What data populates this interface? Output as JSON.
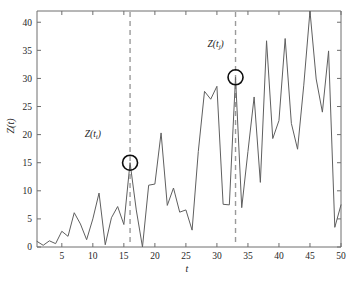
{
  "chart_data": {
    "type": "line",
    "title": "",
    "xlabel": "t",
    "ylabel": "Z(t)",
    "xlim": [
      1,
      50
    ],
    "ylim": [
      0,
      42
    ],
    "grid": false,
    "legend": null,
    "xticks": [
      5,
      10,
      15,
      20,
      25,
      30,
      35,
      40,
      45,
      50
    ],
    "yticks": [
      0,
      5,
      10,
      15,
      20,
      25,
      30,
      35,
      40
    ],
    "x": [
      1,
      2,
      3,
      4,
      5,
      6,
      7,
      8,
      9,
      10,
      11,
      12,
      13,
      14,
      15,
      16,
      17,
      18,
      19,
      20,
      21,
      22,
      23,
      24,
      25,
      26,
      27,
      28,
      29,
      30,
      31,
      32,
      33,
      34,
      35,
      36,
      37,
      38,
      39,
      40,
      41,
      42,
      43,
      44,
      45,
      46,
      47,
      48,
      49,
      50
    ],
    "series": [
      {
        "name": "Z(t)",
        "color": "#5f5f5f",
        "values": [
          1.0,
          0.3,
          1.1,
          0.6,
          2.8,
          1.9,
          6.1,
          4.1,
          1.3,
          5.0,
          9.6,
          0.4,
          5.2,
          7.2,
          4.0,
          15.0,
          6.6,
          0.0,
          11.0,
          11.2,
          20.3,
          7.4,
          10.5,
          6.2,
          6.6,
          3.0,
          17.0,
          27.7,
          26.3,
          28.6,
          7.6,
          7.5,
          30.2,
          7.0,
          17.0,
          26.7,
          11.5,
          36.7,
          19.3,
          22.5,
          37.1,
          22.0,
          17.4,
          28.8,
          42.0,
          29.9,
          24.0,
          34.9,
          3.5,
          7.5
        ]
      }
    ],
    "markers": [
      {
        "name": "marker-i",
        "x": 16,
        "y": 15.0,
        "radius": 7.5
      },
      {
        "name": "marker-j",
        "x": 33,
        "y": 30.2,
        "radius": 7.5
      }
    ],
    "guide_lines": [
      {
        "name": "guide-line-i",
        "x": 16
      },
      {
        "name": "guide-line-j",
        "x": 33
      }
    ],
    "annotations": [
      {
        "name": "annotation-zti",
        "base": "Z(t",
        "sub": "i",
        "tail": ")",
        "x": 10.0,
        "y": 19.6
      },
      {
        "name": "annotation-ztj",
        "base": "Z(t",
        "sub": "j",
        "tail": ")",
        "x": 29.8,
        "y": 35.6
      }
    ]
  }
}
